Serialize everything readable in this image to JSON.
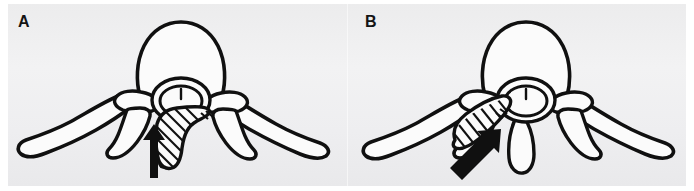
{
  "figure": {
    "type": "anatomical-line-illustration",
    "background_color": "#eeeef0",
    "page_color": "#ffffff",
    "ink_color": "#101010",
    "panel_count": 2
  },
  "panels": [
    {
      "id": "A",
      "label": "A",
      "herniation_type": "central",
      "arrow_direction": "up",
      "arrow_label": "",
      "structures": [
        "vertebral-body",
        "spinal-cord",
        "spinal-canal",
        "pedicle",
        "lamina",
        "transverse-process-left",
        "transverse-process-right",
        "spinous-process",
        "herniated-disc-hatched"
      ]
    },
    {
      "id": "B",
      "label": "B",
      "herniation_type": "lateral",
      "arrow_direction": "up-right",
      "arrow_label": "",
      "structures": [
        "vertebral-body",
        "spinal-cord",
        "spinal-canal",
        "pedicle",
        "lamina",
        "transverse-process-left",
        "transverse-process-right",
        "spinous-process",
        "herniated-disc-hatched"
      ]
    }
  ]
}
